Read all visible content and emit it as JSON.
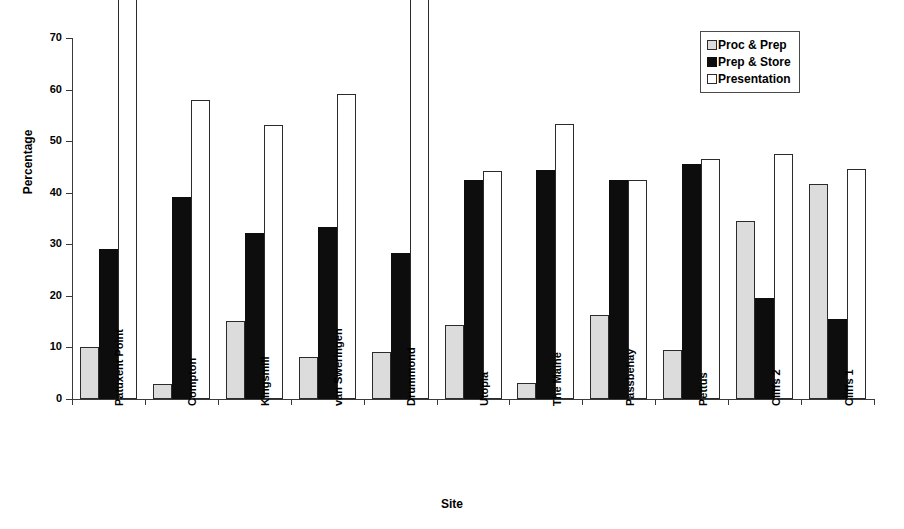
{
  "chart_data": {
    "type": "bar",
    "title": "",
    "xlabel": "Site",
    "ylabel": "Percentage",
    "ylim": [
      0,
      70
    ],
    "yticks": [
      0,
      10,
      20,
      30,
      40,
      50,
      60,
      70
    ],
    "grid": false,
    "legend_position": "top-right",
    "categories": [
      "Patuxent Point",
      "Compton",
      "Kingsmill",
      "van Sweringen",
      "Drummond",
      "Utopia",
      "The Maine",
      "Passbehay",
      "Pettus",
      "Cliffs 2",
      "Cliffs 1"
    ],
    "series": [
      {
        "name": "Proc & Prep",
        "color": "#dcdcdc",
        "values": [
          10.0,
          3.0,
          15.2,
          8.1,
          9.2,
          14.3,
          3.2,
          16.3,
          9.5,
          34.6,
          41.6
        ]
      },
      {
        "name": "Prep & Store",
        "color": "#0d0d0d",
        "values": [
          29.1,
          39.2,
          32.2,
          33.3,
          28.3,
          42.4,
          44.5,
          42.5,
          45.5,
          19.6,
          15.6
        ]
      },
      {
        "name": "Presentation",
        "color": "#ffffff",
        "values": [
          81.0,
          58.0,
          53.2,
          59.2,
          83.3,
          44.2,
          53.3,
          42.5,
          46.5,
          47.5,
          44.6
        ]
      }
    ]
  },
  "legend": {
    "items": [
      {
        "label": "Proc & Prep"
      },
      {
        "label": "Prep & Store"
      },
      {
        "label": "Presentation"
      }
    ]
  }
}
